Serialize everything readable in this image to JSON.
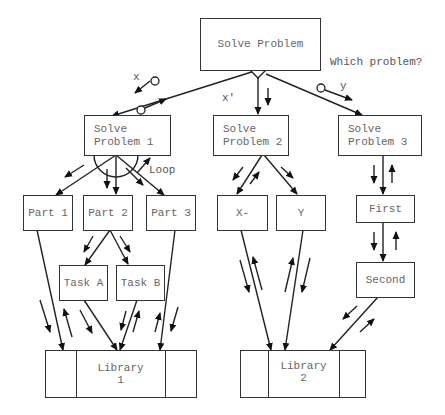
{
  "diagram": {
    "type": "structure-chart",
    "nodes": {
      "root": "Solve Problem",
      "p1": "Solve\nProblem 1",
      "p2": "Solve\nProblem 2",
      "p3": "Solve\nProblem 3",
      "part1": "Part 1",
      "part2": "Part 2",
      "part3": "Part 3",
      "taskA": "Task A",
      "taskB": "Task B",
      "x": "X-",
      "y": "Y",
      "first": "First",
      "second": "Second",
      "lib1": "Library\n1",
      "lib2": "Library\n2"
    },
    "labels": {
      "decision": "Which problem?",
      "x_param": "x",
      "xprime_param": "x'",
      "y_param": "y",
      "loop": "Loop"
    },
    "colors": {
      "line": "#222222",
      "text": "#666666",
      "background": "#ffffff"
    }
  }
}
